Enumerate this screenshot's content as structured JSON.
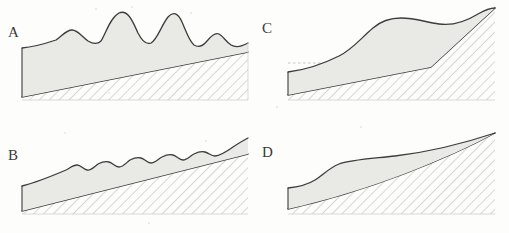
{
  "figure": {
    "background_color": "#fdfdfc",
    "panel_count": 4
  },
  "style": {
    "fill_color": "#e9e9e6",
    "outline_color": "#3c3c3c",
    "hatch_color": "#b9b9b4",
    "dotted_line_color": "#c9c9c4",
    "label_color": "#3a3a3a"
  },
  "panels": [
    {
      "id": "A",
      "label": "A",
      "position": "top-left",
      "surface_type": "large-irregular-dunes",
      "description": "Thick cover with several large rounded bedforms of varying amplitude",
      "bedform_count": 5,
      "has_reference_line": false
    },
    {
      "id": "B",
      "label": "B",
      "position": "bottom-left",
      "surface_type": "small-uniform-ripples",
      "description": "Thinner wedge of cover with small regular ripples on a planar slope",
      "bedform_count": 6,
      "has_reference_line": false
    },
    {
      "id": "C",
      "label": "C",
      "position": "top-right",
      "surface_type": "smooth-convex-bulge",
      "description": "Cover thickens into a single broad convex accumulation against a steep bedrock face",
      "bedform_count": 1,
      "has_reference_line": true
    },
    {
      "id": "D",
      "label": "D",
      "position": "bottom-right",
      "surface_type": "smooth-planar",
      "description": "Smooth featureless cover tapering along an inclined bedrock surface",
      "bedform_count": 0,
      "has_reference_line": false
    }
  ],
  "legend": {
    "fill_meaning": "unconsolidated cover / sediment",
    "hatch_meaning": "bedrock"
  }
}
